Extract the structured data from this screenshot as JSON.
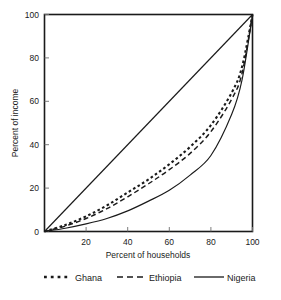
{
  "chart_data": {
    "type": "line",
    "title": "",
    "xlabel": "Percent of households",
    "ylabel": "Percent of income",
    "xlim": [
      0,
      100
    ],
    "ylim": [
      0,
      100
    ],
    "grid": false,
    "legend_position": "bottom",
    "xticks": [
      20,
      40,
      60,
      80,
      100
    ],
    "yticks": [
      0,
      20,
      40,
      60,
      80,
      100
    ],
    "x": [
      0,
      10,
      20,
      30,
      40,
      50,
      60,
      70,
      80,
      90,
      95,
      100
    ],
    "series": [
      {
        "name": "Equality line",
        "style": "solid",
        "in_legend": false,
        "values": [
          0,
          10,
          20,
          30,
          40,
          50,
          60,
          70,
          80,
          90,
          95,
          100
        ]
      },
      {
        "name": "Ghana",
        "style": "dotted",
        "in_legend": true,
        "values": [
          0,
          3,
          7,
          12,
          18,
          24,
          31,
          39,
          49,
          64,
          76,
          100
        ]
      },
      {
        "name": "Ethiopia",
        "style": "dashed",
        "in_legend": true,
        "values": [
          0,
          2.5,
          6,
          10.5,
          16,
          22,
          28.5,
          36,
          46,
          61,
          73,
          100
        ]
      },
      {
        "name": "Nigeria",
        "style": "solid",
        "in_legend": true,
        "values": [
          0,
          1.5,
          3.5,
          6,
          9.5,
          14,
          19,
          26,
          35,
          54,
          70,
          100
        ]
      }
    ]
  },
  "axes": {
    "y_title": "Percent of income",
    "x_title": "Percent of households",
    "x_tick_labels": [
      "20",
      "40",
      "60",
      "80",
      "100"
    ],
    "y_tick_labels": [
      "0",
      "20",
      "40",
      "60",
      "80",
      "100"
    ]
  },
  "legend": {
    "entries": [
      {
        "label": "Ghana",
        "style": "dotted"
      },
      {
        "label": "Ethiopia",
        "style": "dashed"
      },
      {
        "label": "Nigeria",
        "style": "solid"
      }
    ]
  },
  "colors": {
    "ink": "#1a1a1a",
    "background": "#ffffff",
    "tick": "#6e6e6e"
  }
}
